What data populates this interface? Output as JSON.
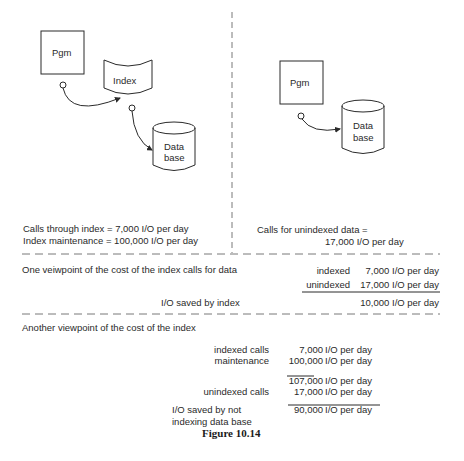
{
  "left_panel": {
    "pgm_label": "Pgm",
    "index_label": "Index",
    "database_label_line1": "Data",
    "database_label_line2": "base",
    "calls_through_index": "Calls through index = 7,000 I/O per day",
    "index_maintenance": "Index maintenance = 100,000 I/O per day"
  },
  "right_panel": {
    "pgm_label": "Pgm",
    "database_label_line1": "Data",
    "database_label_line2": "base",
    "calls_unindexed_line1": "Calls for unindexed data =",
    "calls_unindexed_line2": "17,000 I/O per day"
  },
  "viewpoint_one": {
    "heading": "One veiwpoint of the cost of the index calls for data",
    "rows": [
      {
        "label": "indexed",
        "value": "7,000 I/O per day"
      },
      {
        "label": "unindexed",
        "value": "17,000 I/O per day"
      }
    ],
    "result_label": "I/O saved by index",
    "result_value": "10,000 I/O per day"
  },
  "viewpoint_two": {
    "heading": "Another viewpoint of the cost of the index",
    "rows": [
      {
        "label": "indexed calls",
        "number": "7,000",
        "unit": "I/O per day"
      },
      {
        "label": "maintenance",
        "number": "100,000",
        "unit": "I/O per day"
      },
      {
        "label": "",
        "number": "107,000",
        "unit": "I/O per day"
      },
      {
        "label": "unindexed calls",
        "number": "17,000",
        "unit": "I/O per day"
      }
    ],
    "result_label_line1": "I/O saved by not",
    "result_label_line2": "indexing data base",
    "result_number": "90,000",
    "result_unit": "I/O per day"
  },
  "caption": "Figure 10.14",
  "colors": {
    "ink": "#2a2a2a",
    "background": "#ffffff"
  }
}
